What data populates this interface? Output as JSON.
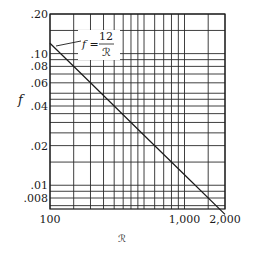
{
  "chart_data": {
    "type": "line",
    "title": "",
    "xlabel": "ℛ",
    "ylabel": "f",
    "xscale": "log",
    "yscale": "log",
    "xlim": [
      100,
      2000
    ],
    "ylim": [
      0.0066,
      0.2
    ],
    "grid": true,
    "x_ticks": [
      {
        "value": 100,
        "label": "100"
      },
      {
        "value": 1000,
        "label": "1,000"
      },
      {
        "value": 2000,
        "label": "2,000"
      }
    ],
    "y_ticks": [
      {
        "value": 0.2,
        "label": ".20"
      },
      {
        "value": 0.1,
        "label": ".10"
      },
      {
        "value": 0.08,
        "label": ".08"
      },
      {
        "value": 0.06,
        "label": ".06"
      },
      {
        "value": 0.04,
        "label": ".04"
      },
      {
        "value": 0.02,
        "label": ".02"
      },
      {
        "value": 0.01,
        "label": ".01"
      },
      {
        "value": 0.008,
        "label": ".008"
      }
    ],
    "x_gridlines": [
      100,
      150,
      200,
      250,
      300,
      350,
      400,
      450,
      500,
      600,
      700,
      800,
      900,
      1000,
      1500,
      2000
    ],
    "y_gridlines": [
      0.2,
      0.15,
      0.1,
      0.09,
      0.08,
      0.07,
      0.06,
      0.05,
      0.045,
      0.04,
      0.035,
      0.03,
      0.025,
      0.02,
      0.015,
      0.01,
      0.009,
      0.008,
      0.007
    ],
    "series": [
      {
        "name": "f = 12/ℛ",
        "x": [
          100,
          200,
          500,
          1000,
          2000
        ],
        "y": [
          0.12,
          0.06,
          0.024,
          0.012,
          0.006
        ]
      }
    ],
    "annotations": [
      {
        "text_left": "f =",
        "numerator": "12",
        "denominator": "ℛ",
        "points_to": [
          100,
          0.12
        ]
      }
    ]
  }
}
